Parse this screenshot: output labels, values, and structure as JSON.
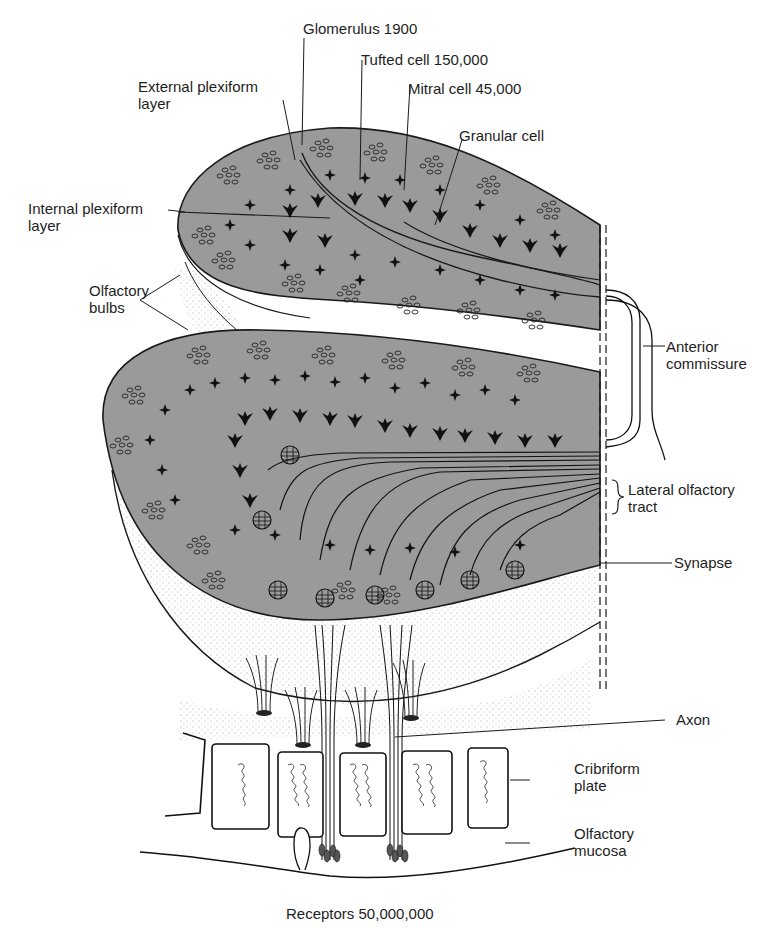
{
  "figure": {
    "colors": {
      "bulb_fill": "#9a9a9a",
      "ink": "#1a1a1a",
      "paper": "#ffffff",
      "stipple": "#b5b5b5"
    }
  },
  "labels": {
    "glomerulus": "Glomerulus 1900",
    "tufted_cell": "Tufted cell 150,000",
    "external_plexiform": {
      "line1": "External plexiform",
      "line2": "layer"
    },
    "mitral_cell": "Mitral cell 45,000",
    "granular_cell": "Granular cell",
    "internal_plexiform": {
      "line1": "Internal plexiform",
      "line2": "layer"
    },
    "olfactory_bulbs": {
      "line1": "Olfactory",
      "line2": "bulbs"
    },
    "anterior_commissure": {
      "line1": "Anterior",
      "line2": "commissure"
    },
    "lateral_olfactory_tract": {
      "line1": "Lateral olfactory",
      "line2": "tract"
    },
    "synapse": "Synapse",
    "axon": "Axon",
    "cribriform_plate": {
      "line1": "Cribriform",
      "line2": "plate"
    },
    "olfactory_mucosa": {
      "line1": "Olfactory",
      "line2": "mucosa"
    },
    "receptors": "Receptors 50,000,000"
  }
}
